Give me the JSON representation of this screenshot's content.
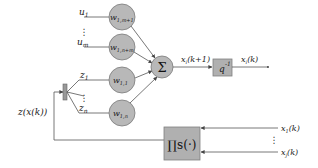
{
  "diagram": {
    "inputs_u": [
      {
        "label": "u",
        "sub": "1",
        "weight": "w",
        "weight_sub": "1,m+1"
      },
      {
        "label": "u",
        "sub": "m",
        "weight": "w",
        "weight_sub": "1,n+m"
      }
    ],
    "inputs_z": [
      {
        "label": "z",
        "sub": "1",
        "weight": "w",
        "weight_sub": "1,1"
      },
      {
        "label": "z",
        "sub": "n",
        "weight": "w",
        "weight_sub": "1,n"
      }
    ],
    "ellipsis": "⋮",
    "sum_symbol": "Σ",
    "sum_output_label": "x",
    "sum_output_sub": "i",
    "sum_output_arg": "(k+1)",
    "delay_label": "q",
    "delay_sup": "-1",
    "delay_output_label": "x",
    "delay_output_sub": "i",
    "delay_output_arg": "(k)",
    "feedback_label": "z(x(k))",
    "product_label": "∏s(·)",
    "product_inputs": [
      {
        "label": "x",
        "sub": "1",
        "arg": "(k)"
      },
      {
        "label": "x",
        "sub": "j",
        "arg": "(k)"
      }
    ]
  }
}
